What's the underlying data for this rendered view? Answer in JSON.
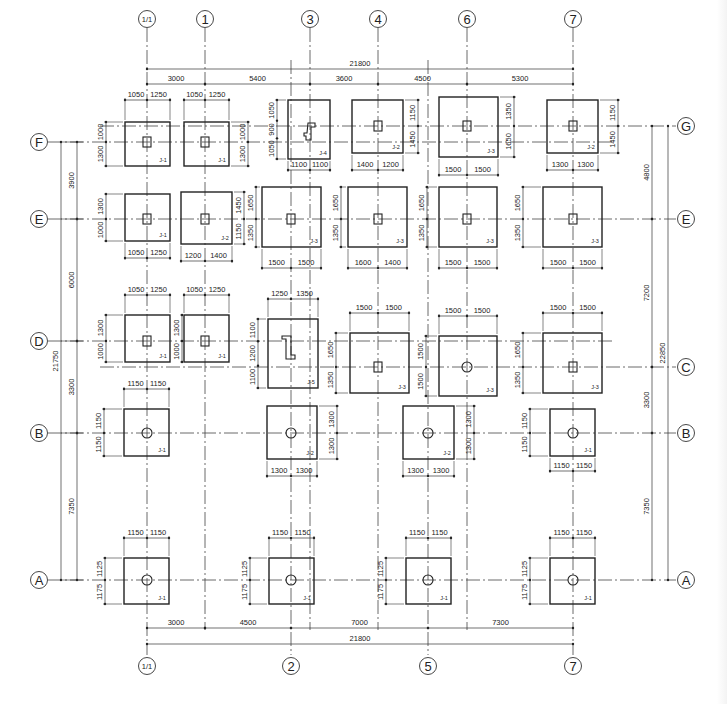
{
  "drawing": {
    "type": "foundation-plan",
    "axes_x": [
      {
        "id": "1/1",
        "x": 147,
        "top_bubble": true,
        "bottom_bubble": true
      },
      {
        "id": "1",
        "x": 205,
        "top_bubble": true,
        "bottom_bubble": false
      },
      {
        "id": "2",
        "x": 291,
        "top_bubble": false,
        "bottom_bubble": true
      },
      {
        "id": "3",
        "x": 310,
        "top_bubble": true,
        "bottom_bubble": false
      },
      {
        "id": "4",
        "x": 378,
        "top_bubble": true,
        "bottom_bubble": false
      },
      {
        "id": "5",
        "x": 428,
        "top_bubble": false,
        "bottom_bubble": true
      },
      {
        "id": "6",
        "x": 467,
        "top_bubble": true,
        "bottom_bubble": false
      },
      {
        "id": "7",
        "x": 573,
        "top_bubble": true,
        "bottom_bubble": true
      }
    ],
    "axes_y": [
      {
        "id": "G",
        "y": 126,
        "left_bubble": false,
        "right_bubble": true
      },
      {
        "id": "F",
        "y": 142,
        "left_bubble": true,
        "right_bubble": false
      },
      {
        "id": "E",
        "y": 219,
        "left_bubble": true,
        "right_bubble": true
      },
      {
        "id": "D",
        "y": 341,
        "left_bubble": true,
        "right_bubble": false
      },
      {
        "id": "C",
        "y": 367,
        "left_bubble": false,
        "right_bubble": true
      },
      {
        "id": "B",
        "y": 433,
        "left_bubble": true,
        "right_bubble": true
      },
      {
        "id": "A",
        "y": 580,
        "left_bubble": true,
        "right_bubble": true
      }
    ],
    "top_dimensions": {
      "overall": {
        "value": "21800",
        "from": 147,
        "to": 573,
        "y": 69
      },
      "segments": [
        {
          "value": "3000",
          "from": 147,
          "to": 205
        },
        {
          "value": "5400",
          "from": 205,
          "to": 310
        },
        {
          "value": "3600",
          "from": 310,
          "to": 378
        },
        {
          "value": "4500",
          "from": 378,
          "to": 467
        },
        {
          "value": "5300",
          "from": 467,
          "to": 573
        }
      ],
      "segments_y": 84
    },
    "bottom_dimensions": {
      "segments": [
        {
          "value": "3000",
          "from": 147,
          "to": 205
        },
        {
          "value": "4500",
          "from": 205,
          "to": 291
        },
        {
          "value": "7000",
          "from": 291,
          "to": 428
        },
        {
          "value": "7300",
          "from": 428,
          "to": 573
        }
      ],
      "segments_y": 628,
      "overall": {
        "value": "21800",
        "from": 147,
        "to": 573,
        "y": 644
      }
    },
    "left_dimensions": {
      "overall": {
        "value": "21750",
        "from": 142,
        "to": 580,
        "x": 61
      },
      "segments": [
        {
          "value": "3900",
          "from": 142,
          "to": 219
        },
        {
          "value": "6000",
          "from": 219,
          "to": 341
        },
        {
          "value": "3300",
          "from": 341,
          "to": 433
        },
        {
          "value": "7350",
          "from": 433,
          "to": 580
        }
      ],
      "segments_x": 77
    },
    "right_dimensions": {
      "segments": [
        {
          "value": "4800",
          "from": 126,
          "to": 219
        },
        {
          "value": "7200",
          "from": 219,
          "to": 367
        },
        {
          "value": "3300",
          "from": 367,
          "to": 433
        },
        {
          "value": "7350",
          "from": 433,
          "to": 580
        }
      ],
      "segments_x": 652,
      "overall": {
        "value": "22850",
        "from": 126,
        "to": 580,
        "x": 668
      }
    },
    "footings": [
      {
        "label": "J-1",
        "cx": 147,
        "cy": 142,
        "x1": 125,
        "x2": 170,
        "y1": 122,
        "y2": 166,
        "col": "rect",
        "dimTop": [
          "1050",
          "1250"
        ],
        "dimTopY": 100,
        "dimSide": [
          "1000",
          "1300"
        ],
        "side": "left",
        "sideX": 106
      },
      {
        "label": "J-1",
        "cx": 205,
        "cy": 142,
        "x1": 184,
        "x2": 229,
        "y1": 122,
        "y2": 166,
        "col": "rect",
        "dimTop": [
          "1050",
          "1250"
        ],
        "dimTopY": 100,
        "dimSide": [
          "1000",
          "1300"
        ],
        "side": "right",
        "sideX": 248
      },
      {
        "label": "J-4",
        "cx": 310,
        "cy": 126,
        "x1": 288,
        "x2": 330,
        "y1": 100,
        "y2": 159,
        "col": "z1",
        "dimBottom": [
          "1100",
          "1100"
        ],
        "dimBottomY": 170,
        "dimSide": [
          "1050",
          "900",
          "1050"
        ],
        "side": "left",
        "sideX": 277
      },
      {
        "label": "J-2",
        "cx": 378,
        "cy": 126,
        "x1": 352,
        "x2": 403,
        "y1": 100,
        "y2": 153,
        "col": "rect",
        "dimBottom": [
          "1400",
          "1200"
        ],
        "dimBottomY": 170,
        "dimSide": [
          "1150",
          "1450"
        ],
        "side": "right",
        "sideX": 418
      },
      {
        "label": "J-3",
        "cx": 467,
        "cy": 126,
        "x1": 439,
        "x2": 498,
        "y1": 97,
        "y2": 157,
        "col": "rect",
        "dimBottom": [
          "1500",
          "1500"
        ],
        "dimBottomY": 175,
        "dimSide": [
          "1350",
          "1650"
        ],
        "side": "right",
        "sideX": 514
      },
      {
        "label": "J-2",
        "cx": 573,
        "cy": 126,
        "x1": 547,
        "x2": 598,
        "y1": 100,
        "y2": 153,
        "col": "rect",
        "dimBottom": [
          "1300",
          "1300"
        ],
        "dimBottomY": 170,
        "dimSide": [
          "1150",
          "1450"
        ],
        "side": "right",
        "sideX": 618
      },
      {
        "label": "J-1",
        "cx": 147,
        "cy": 219,
        "x1": 125,
        "x2": 170,
        "y1": 194,
        "y2": 241,
        "col": "rect",
        "dimBottom": [
          "1050",
          "1250"
        ],
        "dimBottomY": 258,
        "dimSide": [
          "1300",
          "1000"
        ],
        "side": "left",
        "sideX": 106
      },
      {
        "label": "J-2",
        "cx": 205,
        "cy": 219,
        "x1": 181,
        "x2": 232,
        "y1": 192,
        "y2": 244,
        "col": "rect",
        "dimBottom": [
          "1200",
          "1400"
        ],
        "dimBottomY": 261,
        "dimSide": [
          "1450",
          "1150"
        ],
        "side": "right",
        "sideX": 244
      },
      {
        "label": "J-3",
        "cx": 291,
        "cy": 219,
        "x1": 262,
        "x2": 321,
        "y1": 187,
        "y2": 247,
        "col": "rect",
        "dimBottom": [
          "1500",
          "1500"
        ],
        "dimBottomY": 268,
        "dimSide": [
          "1650",
          "1350"
        ],
        "side": "left",
        "sideX": 256
      },
      {
        "label": "J-3",
        "cx": 378,
        "cy": 219,
        "x1": 348,
        "x2": 407,
        "y1": 187,
        "y2": 247,
        "col": "rect",
        "dimBottom": [
          "1600",
          "1400"
        ],
        "dimBottomY": 268,
        "dimSide": [
          "1650",
          "1350"
        ],
        "side": "left",
        "sideX": 341
      },
      {
        "label": "J-3",
        "cx": 467,
        "cy": 219,
        "x1": 439,
        "x2": 497,
        "y1": 187,
        "y2": 247,
        "col": "rect",
        "dimBottom": [
          "1500",
          "1500"
        ],
        "dimBottomY": 268,
        "dimSide": [
          "1650",
          "1350"
        ],
        "side": "left",
        "sideX": 427
      },
      {
        "label": "J-3",
        "cx": 573,
        "cy": 219,
        "x1": 543,
        "x2": 602,
        "y1": 187,
        "y2": 247,
        "col": "rect",
        "dimBottom": [
          "1500",
          "1500"
        ],
        "dimBottomY": 268,
        "dimSide": [
          "1650",
          "1350"
        ],
        "side": "left",
        "sideX": 523
      },
      {
        "label": "J-1",
        "cx": 147,
        "cy": 341,
        "x1": 125,
        "x2": 170,
        "y1": 315,
        "y2": 362,
        "col": "rect",
        "dimTop": [
          "1050",
          "1250"
        ],
        "dimTopY": 295,
        "dimSide": [
          "1300",
          "1000"
        ],
        "side": "left",
        "sideX": 106
      },
      {
        "label": "J-1",
        "cx": 205,
        "cy": 341,
        "x1": 184,
        "x2": 229,
        "y1": 315,
        "y2": 362,
        "col": "rect",
        "dimTop": [
          "1050",
          "1250"
        ],
        "dimTopY": 295,
        "dimSide": [
          "1300",
          "1000"
        ],
        "side": "left",
        "sideX": 182
      },
      {
        "label": "J-5",
        "cx": 291,
        "cy": 341,
        "x1": 268,
        "x2": 318,
        "y1": 319,
        "y2": 388,
        "col": "z2",
        "dimTop": [
          "1250",
          "1350"
        ],
        "dimTopY": 299,
        "dimSide": [
          "1100",
          "1200",
          "1100"
        ],
        "side": "left",
        "sideX": 258
      },
      {
        "label": "J-3",
        "cx": 378,
        "cy": 367,
        "x1": 350,
        "x2": 409,
        "y1": 333,
        "y2": 393,
        "col": "rect",
        "dimTop": [
          "1500",
          "1500"
        ],
        "dimTopY": 313,
        "dimSide": [
          "1650",
          "1350"
        ],
        "side": "left",
        "sideX": 336
      },
      {
        "label": "J-3",
        "cx": 467,
        "cy": 367,
        "x1": 439,
        "x2": 497,
        "y1": 336,
        "y2": 396,
        "col": "circle",
        "dimTop": [
          "1500",
          "1500"
        ],
        "dimTopY": 316,
        "dimSide": [
          "1500",
          "1500"
        ],
        "side": "left",
        "sideX": 426
      },
      {
        "label": "J-3",
        "cx": 573,
        "cy": 367,
        "x1": 543,
        "x2": 602,
        "y1": 333,
        "y2": 393,
        "col": "rect",
        "dimTop": [
          "1500",
          "1500"
        ],
        "dimTopY": 313,
        "dimSide": [
          "1650",
          "1350"
        ],
        "side": "left",
        "sideX": 523
      },
      {
        "label": "J-1",
        "cx": 147,
        "cy": 433,
        "x1": 124,
        "x2": 169,
        "y1": 409,
        "y2": 456,
        "col": "circle",
        "dimTop": [
          "1150",
          "1150"
        ],
        "dimTopY": 389,
        "dimSide": [
          "1150",
          "1150"
        ],
        "side": "left",
        "sideX": 104
      },
      {
        "label": "J-2",
        "cx": 291,
        "cy": 433,
        "x1": 267,
        "x2": 317,
        "y1": 406,
        "y2": 459,
        "col": "circle",
        "dimBottom": [
          "1300",
          "1300"
        ],
        "dimBottomY": 476,
        "dimSide": [
          "1300",
          "1300"
        ],
        "side": "right",
        "sideX": 337
      },
      {
        "label": "J-2",
        "cx": 428,
        "cy": 433,
        "x1": 403,
        "x2": 454,
        "y1": 406,
        "y2": 459,
        "col": "circle",
        "dimBottom": [
          "1300",
          "1300"
        ],
        "dimBottomY": 476,
        "dimSide": [
          "1300",
          "1300"
        ],
        "side": "right",
        "sideX": 474
      },
      {
        "label": "J-1",
        "cx": 573,
        "cy": 433,
        "x1": 550,
        "x2": 595,
        "y1": 409,
        "y2": 456,
        "col": "circle",
        "dimBottom": [
          "1150",
          "1150"
        ],
        "dimBottomY": 471,
        "dimSide": [
          "1150",
          "1150"
        ],
        "side": "left",
        "sideX": 530
      },
      {
        "label": "J-1",
        "cx": 147,
        "cy": 580,
        "x1": 124,
        "x2": 169,
        "y1": 558,
        "y2": 604,
        "col": "circle",
        "dimTop": [
          "1150",
          "1150"
        ],
        "dimTopY": 538,
        "dimSide": [
          "1125",
          "1175"
        ],
        "side": "left",
        "sideX": 105
      },
      {
        "label": "J-1",
        "cx": 291,
        "cy": 580,
        "x1": 269,
        "x2": 314,
        "y1": 558,
        "y2": 604,
        "col": "circle",
        "dimTop": [
          "1150",
          "1150"
        ],
        "dimTopY": 538,
        "dimSide": [
          "1125",
          "1175"
        ],
        "side": "left",
        "sideX": 250
      },
      {
        "label": "J-1",
        "cx": 428,
        "cy": 580,
        "x1": 406,
        "x2": 451,
        "y1": 558,
        "y2": 604,
        "col": "circle",
        "dimTop": [
          "1150",
          "1150"
        ],
        "dimTopY": 538,
        "dimSide": [
          "1125",
          "1175"
        ],
        "side": "left",
        "sideX": 386
      },
      {
        "label": "J-1",
        "cx": 573,
        "cy": 580,
        "x1": 550,
        "x2": 595,
        "y1": 558,
        "y2": 604,
        "col": "circle",
        "dimTop": [
          "1150",
          "1150"
        ],
        "dimTopY": 538,
        "dimSide": [
          "1125",
          "1175"
        ],
        "side": "left",
        "sideX": 530
      }
    ]
  }
}
